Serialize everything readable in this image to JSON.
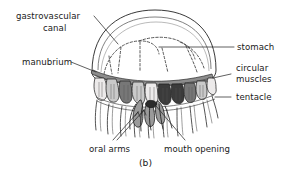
{
  "figure": {
    "caption": "(b)",
    "background_color": "#ffffff",
    "ink_color": "#1a1a1a"
  },
  "labels": {
    "gastrovascular_canal_line1": "gastrovascular",
    "gastrovascular_canal_line2": "canal",
    "manubrium": "manubrium",
    "stomach": "stomach",
    "circular_muscles_line1": "circular",
    "circular_muscles_line2": "muscles",
    "tentacle": "tentacle",
    "oral_arms": "oral arms",
    "mouth_opening": "mouth opening"
  }
}
